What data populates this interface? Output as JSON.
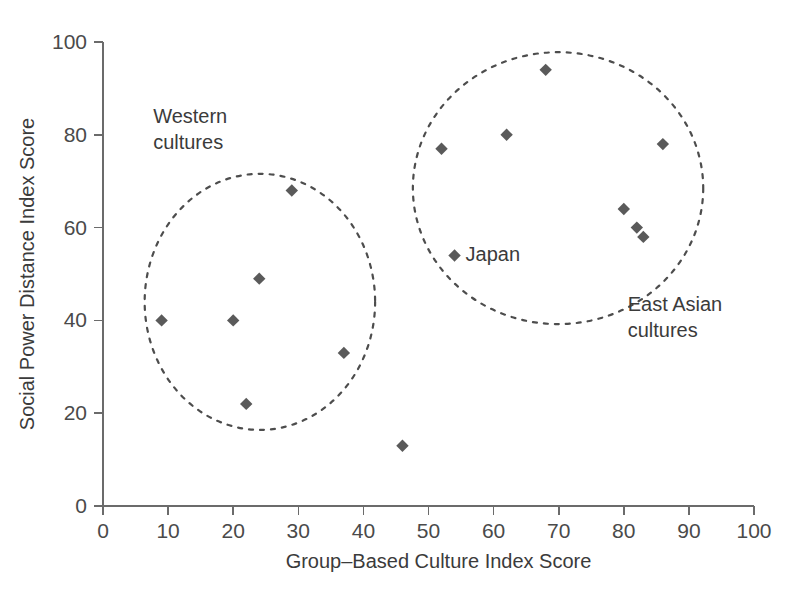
{
  "chart_data": {
    "type": "scatter",
    "title": "",
    "xlabel": "Group–Based Culture Index Score",
    "ylabel": "Social Power Distance Index Score",
    "xlim": [
      0,
      100
    ],
    "ylim": [
      0,
      100
    ],
    "xticks": [
      0,
      10,
      20,
      30,
      40,
      50,
      60,
      70,
      80,
      90,
      100
    ],
    "yticks": [
      0,
      20,
      40,
      60,
      80,
      100
    ],
    "xtick_labels": [
      "0",
      "10",
      "20",
      "30",
      "40",
      "50",
      "60",
      "70",
      "80",
      "90",
      "100"
    ],
    "ytick_labels": [
      "0",
      "20",
      "40",
      "60",
      "80",
      "100"
    ],
    "grid": false,
    "legend": null,
    "marker": "diamond",
    "marker_color": "#5a5a5a",
    "points": [
      {
        "x": 9,
        "y": 40,
        "label": "",
        "group": "Western cultures"
      },
      {
        "x": 20,
        "y": 40,
        "label": "",
        "group": "Western cultures"
      },
      {
        "x": 22,
        "y": 22,
        "label": "",
        "group": "Western cultures"
      },
      {
        "x": 24,
        "y": 49,
        "label": "",
        "group": "Western cultures"
      },
      {
        "x": 29,
        "y": 68,
        "label": "",
        "group": "Western cultures"
      },
      {
        "x": 37,
        "y": 33,
        "label": "",
        "group": "Western cultures"
      },
      {
        "x": 46,
        "y": 13,
        "label": "",
        "group": "ungrouped"
      },
      {
        "x": 52,
        "y": 77,
        "label": "",
        "group": "East Asian cultures"
      },
      {
        "x": 54,
        "y": 54,
        "label": "Japan",
        "group": "East Asian cultures"
      },
      {
        "x": 62,
        "y": 80,
        "label": "",
        "group": "East Asian cultures"
      },
      {
        "x": 68,
        "y": 94,
        "label": "",
        "group": "East Asian cultures"
      },
      {
        "x": 80,
        "y": 64,
        "label": "",
        "group": "East Asian cultures"
      },
      {
        "x": 82,
        "y": 60,
        "label": "",
        "group": "East Asian cultures"
      },
      {
        "x": 83,
        "y": 58,
        "label": "",
        "group": "East Asian cultures"
      },
      {
        "x": 86,
        "y": 78,
        "label": "",
        "group": "East Asian cultures"
      }
    ],
    "annotations": [
      {
        "name": "western-cultures",
        "text_lines": [
          "Western",
          "cultures"
        ],
        "text_x": 7.7,
        "text_y": 82.5,
        "ellipse": {
          "cx": 24.1,
          "cy": 44.0,
          "rx": 17.7,
          "ry": 27.6
        }
      },
      {
        "name": "east-asian-cultures",
        "text_lines": [
          "East Asian",
          "cultures"
        ],
        "text_x": 80.6,
        "text_y": 42.0,
        "ellipse": {
          "cx": 69.9,
          "cy": 68.5,
          "rx": 22.3,
          "ry": 29.3
        }
      }
    ],
    "point_label_offset": {
      "dx": 11,
      "dy": 6
    }
  },
  "axes": {
    "x_title": "Group–Based Culture Index Score",
    "y_title": "Social Power Distance Index Score"
  }
}
